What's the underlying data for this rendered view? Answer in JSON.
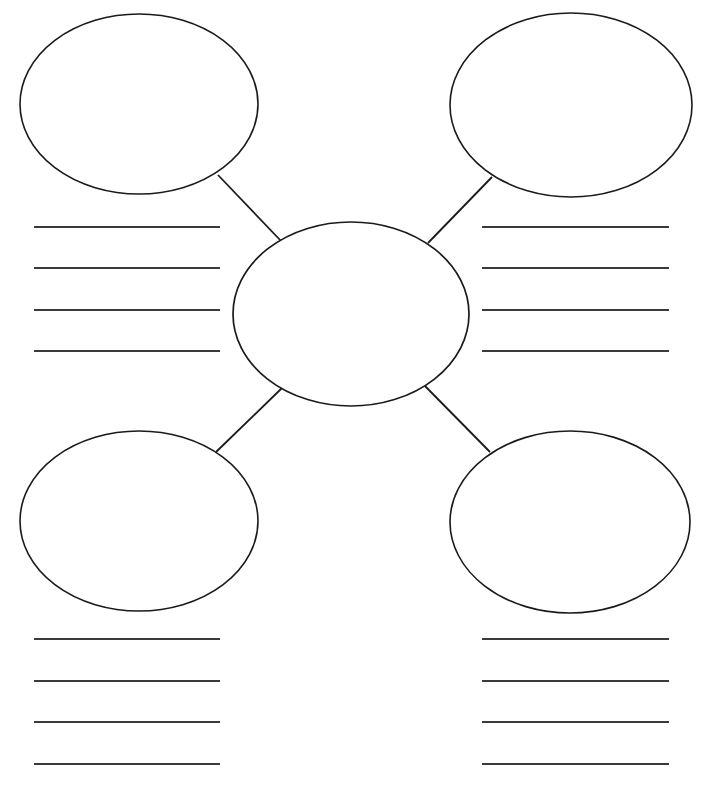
{
  "page": {
    "type": "blank-worksheet",
    "background_color": "#ffffff",
    "width": 707,
    "height": 788
  },
  "style": {
    "shape_stroke_color": "#1a1a1a",
    "connector_stroke_color": "#1a1a1a",
    "rule_stroke_color": "#3a3a3a",
    "shape_fill_color": "#ffffff"
  },
  "center": {
    "name": "center-topic",
    "label": "",
    "cx": 351,
    "cy": 314,
    "rx": 118,
    "ry": 92
  },
  "nodes": [
    {
      "name": "node-top-left",
      "label": "",
      "cx": 139,
      "cy": 104,
      "rx": 119,
      "ry": 90
    },
    {
      "name": "node-top-right",
      "label": "",
      "cx": 571,
      "cy": 105,
      "rx": 121,
      "ry": 92
    },
    {
      "name": "node-bottom-left",
      "label": "",
      "cx": 139,
      "cy": 521,
      "rx": 119,
      "ry": 90
    },
    {
      "name": "node-bottom-right",
      "label": "",
      "cx": 570,
      "cy": 522,
      "rx": 120,
      "ry": 91
    }
  ],
  "connectors": [
    {
      "name": "connector-center-to-top-left",
      "x1": 282,
      "y1": 242,
      "x2": 218,
      "y2": 175
    },
    {
      "name": "connector-center-to-top-right",
      "x1": 428,
      "y1": 243,
      "x2": 492,
      "y2": 177
    },
    {
      "name": "connector-center-to-bottom-left",
      "x1": 282,
      "y1": 388,
      "x2": 216,
      "y2": 452
    },
    {
      "name": "connector-center-to-bottom-right",
      "x1": 425,
      "y1": 386,
      "x2": 490,
      "y2": 452
    }
  ],
  "writing_areas": [
    {
      "name": "writing-lines-top-left",
      "x_start": 34,
      "x_end": 220,
      "lines": [
        {
          "name": "rule-line",
          "value": "",
          "y": 227
        },
        {
          "name": "rule-line",
          "value": "",
          "y": 268
        },
        {
          "name": "rule-line",
          "value": "",
          "y": 310
        },
        {
          "name": "rule-line",
          "value": "",
          "y": 351
        }
      ]
    },
    {
      "name": "writing-lines-top-right",
      "x_start": 482,
      "x_end": 669,
      "lines": [
        {
          "name": "rule-line",
          "value": "",
          "y": 227
        },
        {
          "name": "rule-line",
          "value": "",
          "y": 268
        },
        {
          "name": "rule-line",
          "value": "",
          "y": 310
        },
        {
          "name": "rule-line",
          "value": "",
          "y": 351
        }
      ]
    },
    {
      "name": "writing-lines-bottom-left",
      "x_start": 34,
      "x_end": 220,
      "lines": [
        {
          "name": "rule-line",
          "value": "",
          "y": 639
        },
        {
          "name": "rule-line",
          "value": "",
          "y": 681
        },
        {
          "name": "rule-line",
          "value": "",
          "y": 722
        },
        {
          "name": "rule-line",
          "value": "",
          "y": 764
        }
      ]
    },
    {
      "name": "writing-lines-bottom-right",
      "x_start": 482,
      "x_end": 669,
      "lines": [
        {
          "name": "rule-line",
          "value": "",
          "y": 639
        },
        {
          "name": "rule-line",
          "value": "",
          "y": 681
        },
        {
          "name": "rule-line",
          "value": "",
          "y": 722
        },
        {
          "name": "rule-line",
          "value": "",
          "y": 764
        }
      ]
    }
  ]
}
